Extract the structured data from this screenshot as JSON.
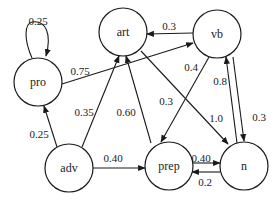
{
  "diagram": {
    "type": "state-transition-graph",
    "nodes": [
      {
        "id": "pro",
        "label": "pro",
        "cx": 38,
        "cy": 82,
        "r": 24
      },
      {
        "id": "art",
        "label": "art",
        "cx": 123,
        "cy": 32,
        "r": 24
      },
      {
        "id": "vb",
        "label": "vb",
        "cx": 217,
        "cy": 34,
        "r": 24
      },
      {
        "id": "adv",
        "label": "adv",
        "cx": 69,
        "cy": 168,
        "r": 24
      },
      {
        "id": "prep",
        "label": "prep",
        "cx": 169,
        "cy": 166,
        "r": 24
      },
      {
        "id": "n",
        "label": "n",
        "cx": 244,
        "cy": 166,
        "r": 24
      }
    ],
    "edges": [
      {
        "from": "pro",
        "to": "pro",
        "label": "0.25",
        "lx": 38,
        "ly": 21
      },
      {
        "from": "pro",
        "to": "vb",
        "label": "0.75",
        "lx": 80,
        "ly": 71
      },
      {
        "from": "vb",
        "to": "art",
        "label": "0.3",
        "lx": 169,
        "ly": 26
      },
      {
        "from": "vb",
        "to": "prep",
        "label": "0.4",
        "lx": 191,
        "ly": 67
      },
      {
        "from": "art",
        "to": "n",
        "label": "1.0",
        "lx": 216,
        "ly": 118
      },
      {
        "from": "art",
        "to": "n",
        "label": "0.3",
        "lx": 166,
        "ly": 101,
        "note": "label on middle diagonal"
      },
      {
        "from": "n",
        "to": "vb",
        "label": "0.8",
        "lx": 220,
        "ly": 81
      },
      {
        "from": "vb",
        "to": "n",
        "label": "0.3",
        "lx": 259,
        "ly": 117
      },
      {
        "from": "adv",
        "to": "pro",
        "label": "0.25",
        "lx": 39,
        "ly": 134
      },
      {
        "from": "adv",
        "to": "art",
        "label": "0.35",
        "lx": 84,
        "ly": 112
      },
      {
        "from": "prep",
        "to": "art",
        "label": "0.60",
        "lx": 126,
        "ly": 112
      },
      {
        "from": "adv",
        "to": "prep",
        "label": "0.40",
        "lx": 113,
        "ly": 158
      },
      {
        "from": "prep",
        "to": "n",
        "label": "0.40",
        "lx": 201,
        "ly": 158
      },
      {
        "from": "n",
        "to": "prep",
        "label": "0.2",
        "lx": 205,
        "ly": 182
      }
    ]
  }
}
